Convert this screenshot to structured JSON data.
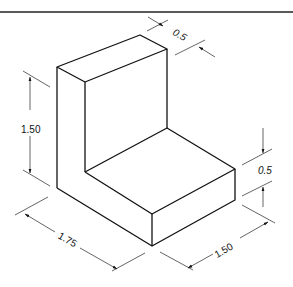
{
  "figure": {
    "type": "isometric-drawing",
    "border_line_color": "#222222",
    "line_color": "#111111"
  },
  "dimensions": {
    "top_thickness": "0.5",
    "height": "1.50",
    "base_height": "0.5",
    "length": "1.75",
    "depth": "1.50"
  }
}
